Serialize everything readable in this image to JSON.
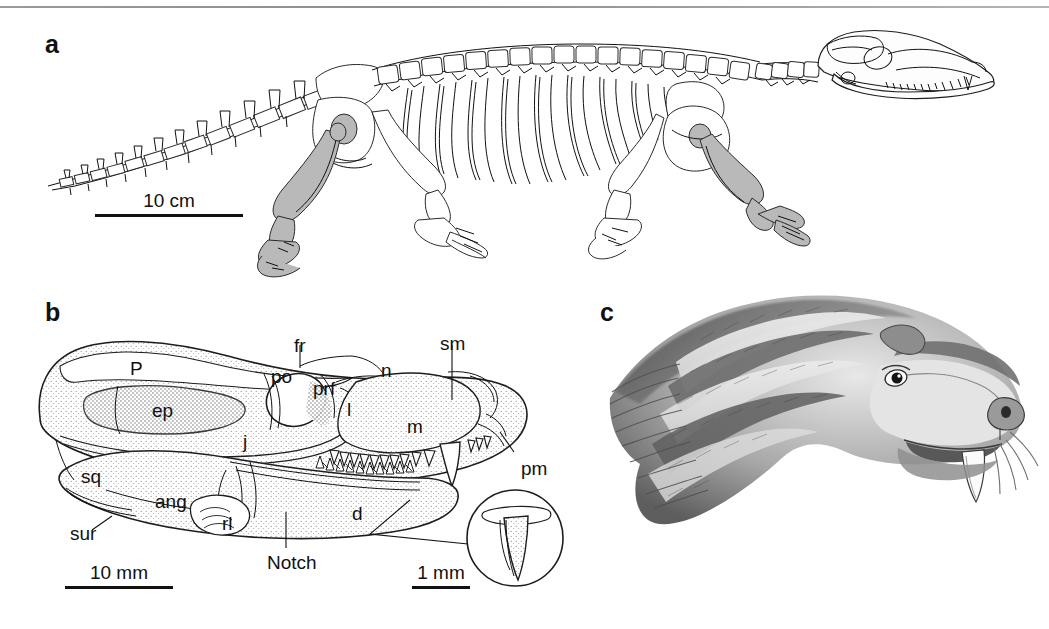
{
  "figure": {
    "panels": [
      {
        "letter": "a",
        "name": "skeletal-reconstruction",
        "scale_bar": {
          "label": "10 cm"
        }
      },
      {
        "letter": "b",
        "name": "skull-diagram",
        "scale_bar": {
          "label": "10 mm"
        },
        "inset_scale_bar": {
          "label": "1 mm"
        },
        "labels": [
          {
            "id": "P",
            "text": "P",
            "x": 130,
            "y": 358,
            "meaning": "parietal"
          },
          {
            "id": "ep",
            "text": "ep",
            "x": 152,
            "y": 400,
            "meaning": "epipterygoid"
          },
          {
            "id": "sq",
            "text": "sq",
            "x": 81,
            "y": 466,
            "meaning": "squamosal"
          },
          {
            "id": "sur",
            "text": "sur",
            "x": 70,
            "y": 523,
            "meaning": "surangular"
          },
          {
            "id": "ang",
            "text": "ang",
            "x": 155,
            "y": 491,
            "meaning": "angular"
          },
          {
            "id": "rl",
            "text": "rl",
            "x": 222,
            "y": 513,
            "meaning": "reflected lamina"
          },
          {
            "id": "j",
            "text": "j",
            "x": 243,
            "y": 431,
            "meaning": "jugal"
          },
          {
            "id": "po",
            "text": "po",
            "x": 271,
            "y": 366,
            "meaning": "postorbital"
          },
          {
            "id": "prf",
            "text": "prf",
            "x": 313,
            "y": 378,
            "meaning": "prefrontal"
          },
          {
            "id": "fr",
            "text": "fr",
            "x": 294,
            "y": 335,
            "meaning": "frontal"
          },
          {
            "id": "l",
            "text": "l",
            "x": 347,
            "y": 399,
            "meaning": "lacrimal"
          },
          {
            "id": "n",
            "text": "n",
            "x": 381,
            "y": 360,
            "meaning": "nasal"
          },
          {
            "id": "m",
            "text": "m",
            "x": 407,
            "y": 416,
            "meaning": "maxilla"
          },
          {
            "id": "sm",
            "text": "sm",
            "x": 440,
            "y": 333,
            "meaning": "septomaxilla"
          },
          {
            "id": "pm",
            "text": "pm",
            "x": 521,
            "y": 458,
            "meaning": "premaxilla"
          },
          {
            "id": "d",
            "text": "d",
            "x": 352,
            "y": 503,
            "meaning": "dentary"
          },
          {
            "id": "Notch",
            "text": "Notch",
            "x": 267,
            "y": 552,
            "meaning": "notch"
          }
        ]
      },
      {
        "letter": "c",
        "name": "life-reconstruction"
      }
    ]
  }
}
